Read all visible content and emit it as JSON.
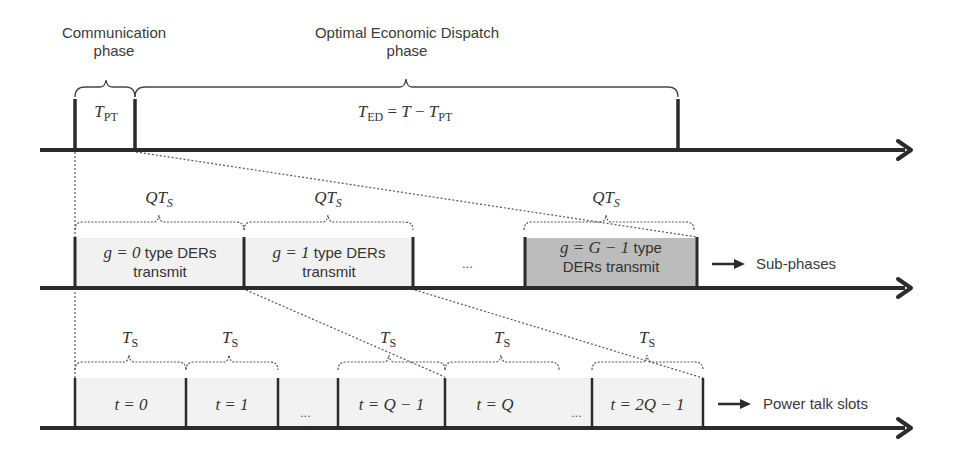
{
  "top": {
    "communication_phase": "Communication\nphase",
    "communication_line1": "Communication",
    "communication_line2": "phase",
    "dispatch_line1": "Optimal Economic Dispatch",
    "dispatch_line2": "phase",
    "t_pt": {
      "base": "T",
      "sub": "PT"
    },
    "t_ed": {
      "base": "T",
      "sub": "ED",
      "rhs": "= T − ",
      "rhs_base": "T",
      "rhs_sub": "PT"
    }
  },
  "subphases": {
    "brace_label": {
      "base": "QT",
      "sub": "S"
    },
    "boxes": [
      {
        "math": "g = 0",
        "line1_rest": " type DERs",
        "line2": "transmit"
      },
      {
        "math": "g = 1",
        "line1_rest": " type DERs",
        "line2": "transmit"
      },
      {
        "math": "g = G − 1",
        "line1_rest": " type",
        "line2": "DERs transmit"
      }
    ],
    "ellipsis": "...",
    "arrow_label": "Sub-phases"
  },
  "slots": {
    "brace_label": {
      "base": "T",
      "sub": "S"
    },
    "boxes": [
      {
        "math": "t = 0"
      },
      {
        "math": "t = 1"
      },
      {
        "math": "t = Q − 1"
      },
      {
        "math": "t = Q"
      },
      {
        "math": "t = 2Q − 1"
      }
    ],
    "ellipsis": "...",
    "arrow_label": "Power talk slots"
  },
  "colors": {
    "axis": "#2b2b2b",
    "shaded_light": "#f0f0f0",
    "shaded_dark": "#bdbdbd",
    "dotted": "#555555"
  }
}
